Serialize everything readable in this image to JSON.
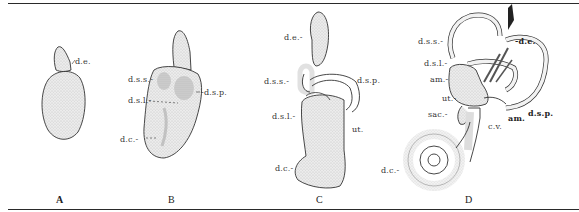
{
  "figure": {
    "panels": [
      {
        "letter": "A",
        "labels": {
          "de": "d.e."
        }
      },
      {
        "letter": "B",
        "labels": {
          "dss": "d.s.s.-",
          "dsl": "d.s.l.-",
          "dsp": "-d.s.p.",
          "dc": "d.c.-"
        }
      },
      {
        "letter": "C",
        "labels": {
          "de": "d.e.-",
          "dss": "d.s.s.-",
          "dsp": "d.s.p.",
          "dsl": "d.s.l.-",
          "ut": "ut.",
          "dc": "d.c.-"
        }
      },
      {
        "letter": "D",
        "labels": {
          "dss": "d.s.s.-",
          "de": "-d.e.",
          "dsl": "d.s.l.-",
          "am1": "am.-",
          "ut": "ut.-",
          "sac": "sac.-",
          "cv": "c.v.",
          "am2": "am.",
          "dsp": "d.s.p.",
          "dc": "d.c.-"
        }
      }
    ]
  },
  "colors": {
    "ink": "#2a2a2a",
    "stipple": "#d9d9d9",
    "background": "#ffffff"
  }
}
